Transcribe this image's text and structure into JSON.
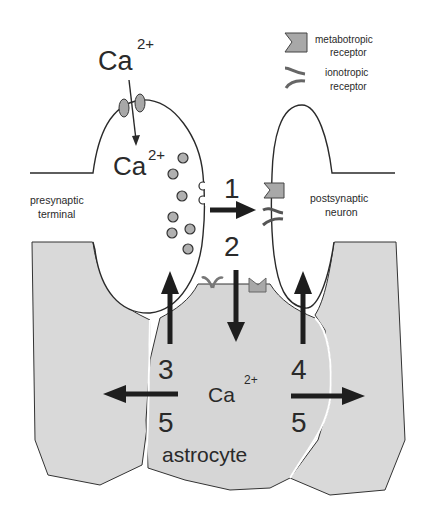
{
  "diagram": {
    "type": "tripartite-synapse",
    "legend": {
      "metabotropic": {
        "line1": "metabotropic",
        "line2": "receptor"
      },
      "ionotropic": {
        "line1": "ionotropic",
        "line2": "receptor"
      }
    },
    "labels": {
      "ca_extracellular": "Ca",
      "ca_extracellular_sup": "2+",
      "ca_intracellular": "Ca",
      "ca_intracellular_sup": "2+",
      "presynaptic_line1": "presynaptic",
      "presynaptic_line2": "terminal",
      "postsynaptic_line1": "postsynaptic",
      "postsynaptic_line2": "neuron",
      "ca_astrocyte": "Ca",
      "ca_astrocyte_sup": "2+",
      "astrocyte": "astrocyte"
    },
    "steps": {
      "s1": "1",
      "s2": "2",
      "s3": "3",
      "s4": "4",
      "s5_left": "5",
      "s5_right": "5"
    },
    "colors": {
      "outline": "#2a2a2a",
      "tissue": "#d9d9d9",
      "receptor": "#a8a8a8",
      "vesicle": "#b0b0b0",
      "arrow": "#1e1e1e"
    }
  }
}
